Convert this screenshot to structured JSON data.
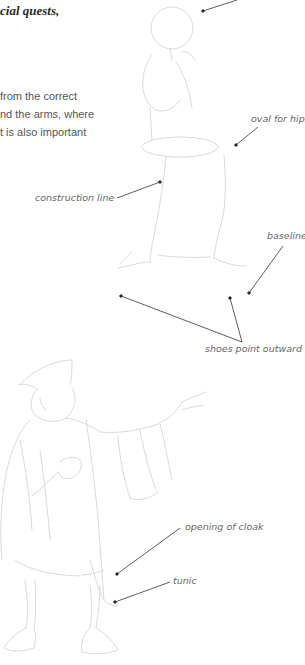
{
  "heading": {
    "text": "cial quests,"
  },
  "body": {
    "lines": [
      "from the correct",
      "nd the arms, where",
      "t is also important"
    ]
  },
  "figure_top": {
    "labels": {
      "oval_for_hips": "oval for hips",
      "construction_line": "construction line",
      "baseline": "baseline",
      "shoes_point_outward": "shoes point outward"
    }
  },
  "figure_bottom": {
    "labels": {
      "opening_of_cloak": "opening of cloak",
      "tunic": "tunic"
    }
  },
  "colors": {
    "sketch": "#d6d6d6",
    "leader": "#333333",
    "label": "#666666"
  }
}
